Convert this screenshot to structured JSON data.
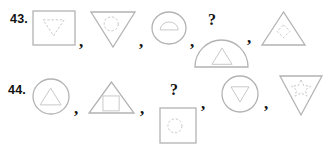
{
  "colors": {
    "background": "#ffffff",
    "label_text": "#111111",
    "outer_shape_stroke": "#b3b3b3",
    "inner_shape_stroke": "#c9c9c9"
  },
  "questions": [
    {
      "number": "43.",
      "separator": ",",
      "placeholder": "?",
      "sequence": [
        {
          "outer": "square",
          "inner": "triangle-down",
          "inner_dashed": true,
          "under_placeholder": false
        },
        {
          "outer": "triangle-down",
          "inner": "circle",
          "inner_dashed": true,
          "under_placeholder": false
        },
        {
          "outer": "circle",
          "inner": "semicircle",
          "inner_dashed": false,
          "under_placeholder": false
        },
        {
          "outer": "semicircle",
          "inner": "triangle-up",
          "inner_dashed": false,
          "under_placeholder": true
        },
        {
          "outer": "triangle-up",
          "inner": "diamond",
          "inner_dashed": true,
          "under_placeholder": false
        }
      ]
    },
    {
      "number": "44.",
      "separator": ",",
      "placeholder": "?",
      "sequence": [
        {
          "outer": "circle",
          "inner": "triangle-up",
          "inner_dashed": false,
          "under_placeholder": false
        },
        {
          "outer": "triangle-up",
          "inner": "square",
          "inner_dashed": false,
          "under_placeholder": false
        },
        {
          "outer": "square",
          "inner": "circle",
          "inner_dashed": true,
          "under_placeholder": true
        },
        {
          "outer": "circle",
          "inner": "triangle-down",
          "inner_dashed": false,
          "under_placeholder": false
        },
        {
          "outer": "triangle-down",
          "inner": "star",
          "inner_dashed": true,
          "under_placeholder": false
        }
      ]
    }
  ]
}
